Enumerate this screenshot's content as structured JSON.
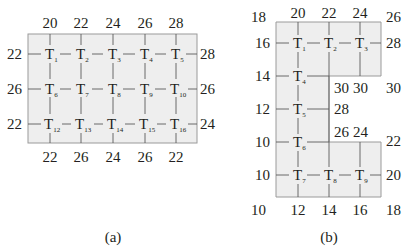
{
  "figure_a": {
    "caption": "(a)",
    "top_labels": [
      "20",
      "22",
      "24",
      "26",
      "28"
    ],
    "bottom_labels": [
      "22",
      "26",
      "24",
      "26",
      "22"
    ],
    "left_labels": [
      "22",
      "26",
      "22"
    ],
    "right_labels": [
      "28",
      "26",
      "24"
    ],
    "nodes": [
      {
        "base": "T",
        "sub": "1"
      },
      {
        "base": "T",
        "sub": "2"
      },
      {
        "base": "T",
        "sub": "3"
      },
      {
        "base": "T",
        "sub": "4"
      },
      {
        "base": "T",
        "sub": "5"
      },
      {
        "base": "T",
        "sub": "6"
      },
      {
        "base": "T",
        "sub": "7"
      },
      {
        "base": "T",
        "sub": "8"
      },
      {
        "base": "T",
        "sub": "9"
      },
      {
        "base": "T",
        "sub": "10"
      },
      {
        "base": "T",
        "sub": "12"
      },
      {
        "base": "T",
        "sub": "13"
      },
      {
        "base": "T",
        "sub": "14"
      },
      {
        "base": "T",
        "sub": "15"
      },
      {
        "base": "T",
        "sub": "16"
      }
    ]
  },
  "figure_b": {
    "caption": "(b)",
    "corner_top_left": "18",
    "corner_top_right": "26",
    "top_labels": [
      "20",
      "22",
      "24"
    ],
    "left_labels": [
      "16",
      "14",
      "12",
      "10",
      "10"
    ],
    "corner_bottom_left": "10",
    "bottom_labels": [
      "12",
      "14",
      "16"
    ],
    "corner_bottom_right": "18",
    "right_label_row1": "28",
    "notch_labels": {
      "under_t2": "30",
      "under_t3": "30",
      "right_of_notch": "30",
      "right_of_t5": "28",
      "above_t8": "26",
      "above_t9": "24",
      "right_upper": "22",
      "right_lower": "20"
    },
    "nodes": [
      {
        "base": "T",
        "sub": "1"
      },
      {
        "base": "T",
        "sub": "2"
      },
      {
        "base": "T",
        "sub": "3"
      },
      {
        "base": "T",
        "sub": "4"
      },
      {
        "base": "T",
        "sub": "5"
      },
      {
        "base": "T",
        "sub": "6"
      },
      {
        "base": "T",
        "sub": "7"
      },
      {
        "base": "T",
        "sub": "8"
      },
      {
        "base": "T",
        "sub": "9"
      }
    ]
  }
}
